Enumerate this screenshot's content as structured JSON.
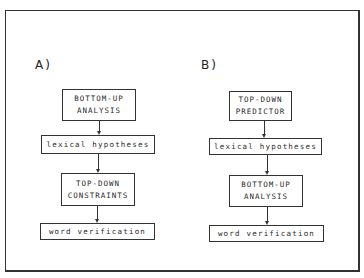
{
  "diagram": {
    "panels": [
      {
        "label": "A)",
        "boxes": [
          {
            "line1": "BOTTOM-UP",
            "line2": "ANALYSIS"
          },
          {
            "text": "lexical hypotheses"
          },
          {
            "line1": "TOP-DOWN",
            "line2": "CONSTRAINTS"
          },
          {
            "text": "word verification"
          }
        ]
      },
      {
        "label": "B)",
        "boxes": [
          {
            "line1": "TOP-DOWN",
            "line2": "PREDICTOR"
          },
          {
            "text": "lexical hypotheses"
          },
          {
            "line1": "BOTTOM-UP",
            "line2": "ANALYSIS"
          },
          {
            "text": "word verification"
          }
        ]
      }
    ],
    "edges": [
      {
        "panel": "A",
        "from": "BOTTOM-UP ANALYSIS",
        "to": "lexical hypotheses"
      },
      {
        "panel": "A",
        "from": "lexical hypotheses",
        "to": "TOP-DOWN CONSTRAINTS"
      },
      {
        "panel": "A",
        "from": "TOP-DOWN CONSTRAINTS",
        "to": "word verification"
      },
      {
        "panel": "B",
        "from": "TOP-DOWN PREDICTOR",
        "to": "lexical hypotheses"
      },
      {
        "panel": "B",
        "from": "lexical hypotheses",
        "to": "BOTTOM-UP ANALYSIS"
      },
      {
        "panel": "B",
        "from": "BOTTOM-UP ANALYSIS",
        "to": "word verification"
      }
    ]
  }
}
